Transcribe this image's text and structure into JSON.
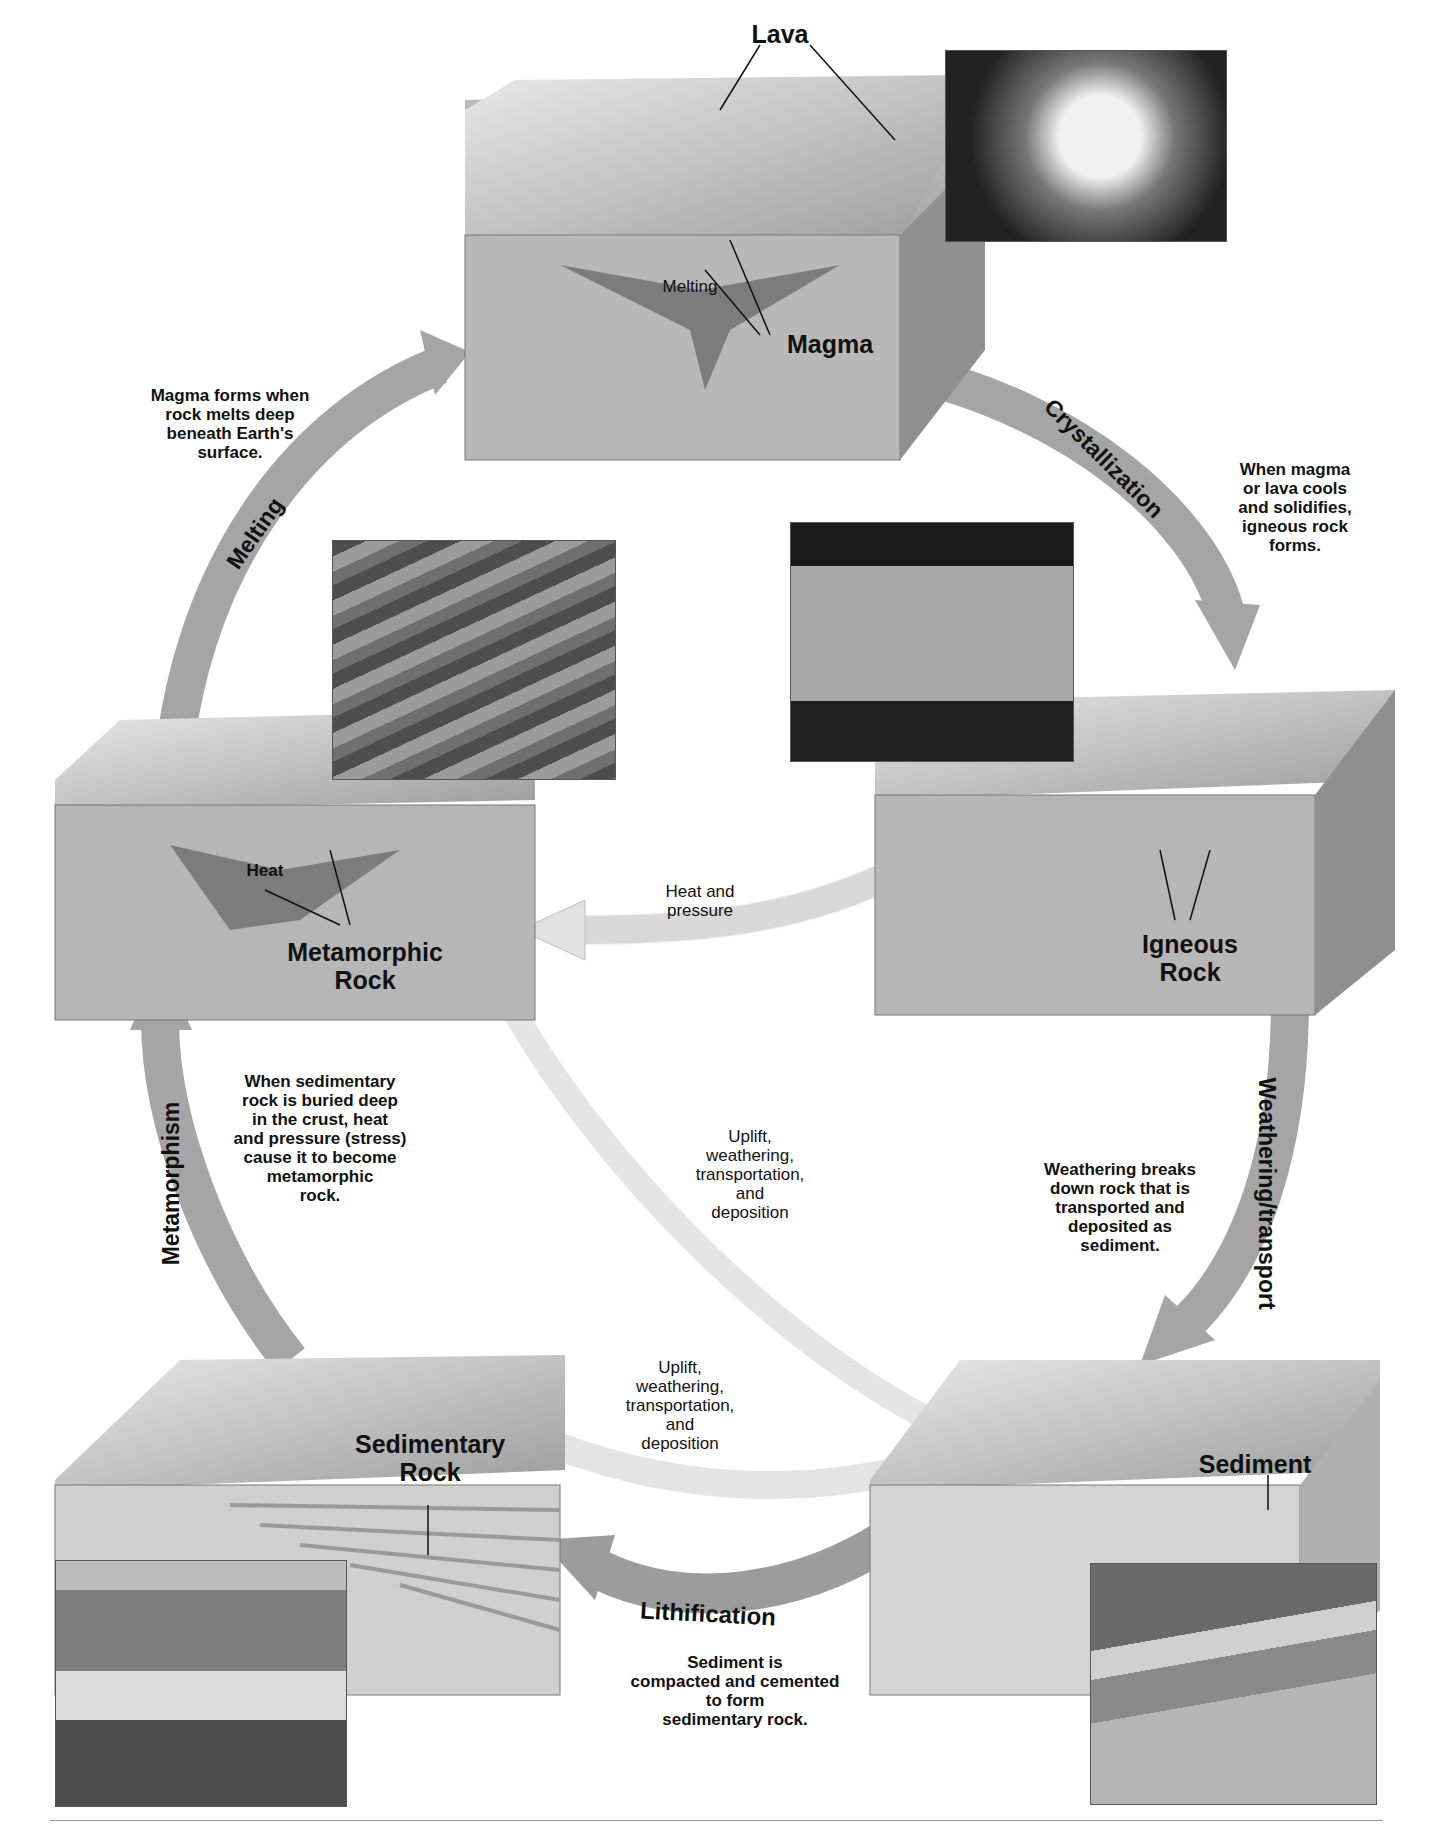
{
  "diagram": {
    "stages": {
      "magma": {
        "label": "Magma",
        "lava_label": "Lava",
        "melting_label": "Melting"
      },
      "igneous": {
        "label_line1": "Igneous",
        "label_line2": "Rock"
      },
      "metamorphic": {
        "label_line1": "Metamorphic",
        "label_line2": "Rock",
        "heat_label": "Heat"
      },
      "sedimentary": {
        "label_line1": "Sedimentary",
        "label_line2": "Rock"
      },
      "sediment": {
        "label": "Sediment"
      }
    },
    "processes": {
      "melting": "Melting",
      "crystallization": "Crystallization",
      "weathering": "Weathering/transport",
      "lithification": "Lithification",
      "metamorphism": "Metamorphism",
      "heat_pressure": [
        "Heat and",
        "pressure"
      ],
      "uplift_center": [
        "Uplift,",
        "weathering,",
        "transportation,",
        "and",
        "deposition"
      ],
      "uplift_bottom": [
        "Uplift,",
        "weathering,",
        "transportation,",
        "and",
        "deposition"
      ]
    },
    "notes": {
      "magma_forms": [
        "Magma forms when",
        "rock melts deep",
        "beneath Earth's",
        "surface."
      ],
      "crystallization": [
        "When magma",
        "or lava cools",
        "and solidifies,",
        "igneous rock",
        "forms."
      ],
      "metamorphism": [
        "When sedimentary",
        "rock is buried deep",
        "in the crust, heat",
        "and pressure (stress)",
        "cause it to become",
        "metamorphic",
        "rock."
      ],
      "weathering": [
        "Weathering breaks",
        "down rock that is",
        "transported and",
        "deposited as",
        "sediment."
      ],
      "lithification": [
        "Sediment is",
        "compacted and cemented",
        "to form",
        "sedimentary rock."
      ]
    },
    "photos": [
      {
        "name": "lava-photo",
        "tone": "#2a2a2a"
      },
      {
        "name": "metamorphic-rock-photo",
        "tone": "#6b6b6b"
      },
      {
        "name": "half-dome-photo",
        "tone": "#7a7a7a"
      },
      {
        "name": "canyon-photo",
        "tone": "#8a8a8a"
      },
      {
        "name": "river-delta-photo",
        "tone": "#9a9a9a"
      }
    ],
    "colors": {
      "arrow_dark": "#9a9a9a",
      "arrow_light": "#e6e6e6",
      "block_side": "#a6a6a6",
      "block_top": "#cfcfcf",
      "text": "#111111"
    }
  }
}
